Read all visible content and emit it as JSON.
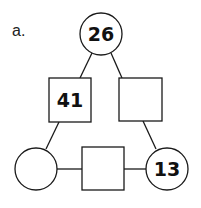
{
  "problem_label": "a.",
  "nodes": {
    "top_circle": {
      "shape": "circle",
      "value": "26"
    },
    "left_square": {
      "shape": "square",
      "value": "41"
    },
    "right_square": {
      "shape": "square",
      "value": ""
    },
    "bottom_left_circle": {
      "shape": "circle",
      "value": ""
    },
    "bottom_square": {
      "shape": "square",
      "value": ""
    },
    "bottom_right_circle": {
      "shape": "circle",
      "value": "13"
    }
  },
  "colors": {
    "stroke": "#1a1a1a",
    "background": "#ffffff"
  }
}
